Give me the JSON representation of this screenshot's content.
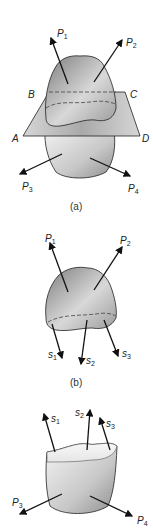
{
  "figure": {
    "parts": [
      {
        "caption": "(a)",
        "plane_labels": [
          "A",
          "B",
          "C",
          "D"
        ],
        "forces": [
          {
            "name": "P",
            "sub": "1"
          },
          {
            "name": "P",
            "sub": "2"
          },
          {
            "name": "P",
            "sub": "3"
          },
          {
            "name": "P",
            "sub": "4"
          }
        ]
      },
      {
        "caption": "(b)",
        "forces": [
          {
            "name": "P",
            "sub": "1"
          },
          {
            "name": "P",
            "sub": "2"
          }
        ],
        "stresses": [
          {
            "name": "s",
            "sub": "1"
          },
          {
            "name": "s",
            "sub": "2"
          },
          {
            "name": "s",
            "sub": "3"
          }
        ]
      },
      {
        "caption": "",
        "forces": [
          {
            "name": "P",
            "sub": "3"
          },
          {
            "name": "P",
            "sub": "4"
          }
        ],
        "stresses": [
          {
            "name": "s",
            "sub": "1"
          },
          {
            "name": "s",
            "sub": "2"
          },
          {
            "name": "s",
            "sub": "3"
          }
        ]
      }
    ],
    "colors": {
      "body_dark": "#8a8a8a",
      "body_light": "#f2f2f2",
      "plane": "#c8c8c8",
      "stroke": "#222222"
    }
  }
}
